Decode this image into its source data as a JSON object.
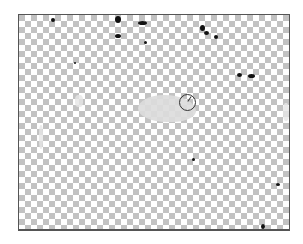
{
  "canvas": {
    "background": "transparent-checkerboard",
    "checker_colors": [
      "#ffffff",
      "#c2c2c2"
    ],
    "checker_size_px": 6,
    "border_color": "#555555"
  },
  "brush_cursor": {
    "icon": "brush-circle-cursor",
    "center": [
      187,
      101
    ],
    "radius": 8
  },
  "specks": [
    {
      "x": 50,
      "y": 17,
      "w": 4,
      "h": 4
    },
    {
      "x": 114,
      "y": 15,
      "w": 6,
      "h": 7
    },
    {
      "x": 137,
      "y": 20,
      "w": 9,
      "h": 4
    },
    {
      "x": 114,
      "y": 33,
      "w": 6,
      "h": 4
    },
    {
      "x": 143,
      "y": 40,
      "w": 3,
      "h": 3
    },
    {
      "x": 199,
      "y": 24,
      "w": 5,
      "h": 6
    },
    {
      "x": 203,
      "y": 30,
      "w": 5,
      "h": 4
    },
    {
      "x": 213,
      "y": 34,
      "w": 4,
      "h": 4
    },
    {
      "x": 236,
      "y": 72,
      "w": 5,
      "h": 4
    },
    {
      "x": 247,
      "y": 73,
      "w": 7,
      "h": 4
    },
    {
      "x": 73,
      "y": 61,
      "w": 2,
      "h": 2
    },
    {
      "x": 191,
      "y": 157,
      "w": 3,
      "h": 3
    },
    {
      "x": 275,
      "y": 182,
      "w": 4,
      "h": 3
    },
    {
      "x": 260,
      "y": 223,
      "w": 4,
      "h": 5
    }
  ],
  "blob": {
    "x": 137,
    "y": 94,
    "w": 56,
    "h": 26,
    "color": "#dcdcdc"
  }
}
